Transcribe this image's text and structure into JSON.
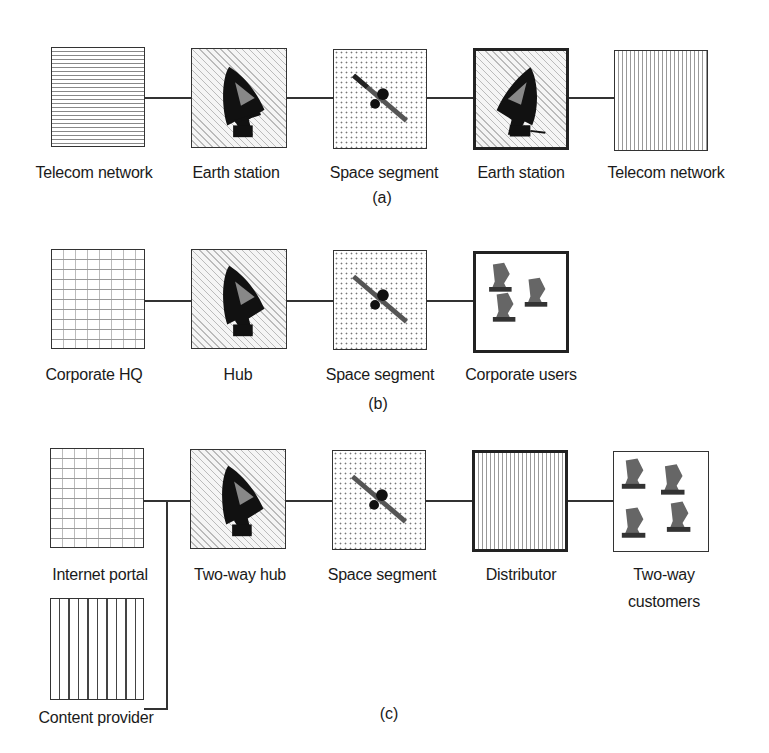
{
  "diagram": {
    "rows": {
      "a": {
        "caption": "(a)",
        "nodes": [
          {
            "label": "Telecom network",
            "icon": "network-pattern"
          },
          {
            "label": "Earth station",
            "icon": "satellite-dish-icon"
          },
          {
            "label": "Space segment",
            "icon": "satellite-icon"
          },
          {
            "label": "Earth station",
            "icon": "satellite-dish-icon"
          },
          {
            "label": "Telecom network",
            "icon": "network-pattern"
          }
        ]
      },
      "b": {
        "caption": "(b)",
        "nodes": [
          {
            "label": "Corporate HQ",
            "icon": "grid-pattern"
          },
          {
            "label": "Hub",
            "icon": "satellite-dish-icon"
          },
          {
            "label": "Space segment",
            "icon": "satellite-icon"
          },
          {
            "label": "Corporate users",
            "icon": "small-dishes-icon",
            "count": 3
          }
        ]
      },
      "c": {
        "caption": "(c)",
        "nodes": [
          {
            "label": "Internet portal",
            "icon": "grid-pattern"
          },
          {
            "label": "Two-way hub",
            "icon": "satellite-dish-icon"
          },
          {
            "label": "Space segment",
            "icon": "satellite-icon"
          },
          {
            "label": "Distributor",
            "icon": "vertical-dots-pattern"
          },
          {
            "label_line1": "Two-way",
            "label_line2": "customers",
            "icon": "small-dishes-icon",
            "count": 4
          },
          {
            "label": "Content provider",
            "icon": "vertical-stripes-pattern"
          }
        ]
      }
    }
  }
}
